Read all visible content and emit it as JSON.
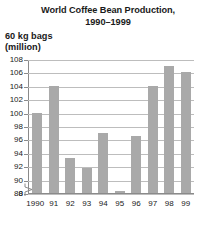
{
  "chart_data": {
    "type": "bar",
    "title": "World Coffee Bean Production, 1990–1999",
    "title_lines": [
      "World Coffee Bean Production,",
      "1990–1999"
    ],
    "ylabel": "60 kg bags (million)",
    "ylabel_lines": [
      "60 kg bags",
      "(million)"
    ],
    "xlabel": "",
    "categories": [
      "1990",
      "91",
      "92",
      "93",
      "94",
      "95",
      "96",
      "97",
      "98",
      "99"
    ],
    "values": [
      100,
      104,
      93.3,
      91.8,
      97,
      88.3,
      96.5,
      104,
      107,
      106
    ],
    "yticks": [
      108,
      106,
      104,
      102,
      100,
      98,
      96,
      94,
      92,
      90,
      88,
      0
    ],
    "ytick_labels": [
      "108",
      "106",
      "104",
      "102",
      "100",
      "98",
      "96",
      "94",
      "92",
      "90",
      "88",
      "0"
    ],
    "ylim": [
      88,
      108
    ],
    "axis_break": true,
    "axis_break_symbol": "zigzag-break",
    "grid": true,
    "grid_axis": "y",
    "legend": false,
    "bar_color": "#a9a9a9",
    "grid_color": "#bdbdbd",
    "axis_color": "#8a8a8a",
    "background_color": "#ffffff",
    "text_color": "#1a1a1a"
  }
}
